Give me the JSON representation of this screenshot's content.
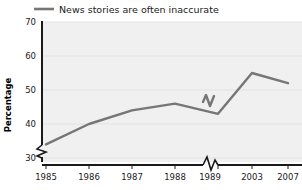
{
  "chart_data": {
    "type": "line",
    "title": "",
    "subtitle": "",
    "xlabel": "",
    "ylabel": "Percentage",
    "legend": [
      {
        "name": "News stories are often inaccurate",
        "color": "#767676",
        "marker": "line-swatch"
      }
    ],
    "legend_position": "top-left",
    "grid": true,
    "grid_axis": "y",
    "x": [
      "1985",
      "1986",
      "1987",
      "1988",
      "1989",
      "2003",
      "2007"
    ],
    "xtick_labels": [
      "1985",
      "1986",
      "1987",
      "1988",
      "1989",
      "2003",
      "2007"
    ],
    "ytick_labels": [
      "30",
      "40",
      "50",
      "60",
      "70"
    ],
    "ytick_values": [
      30,
      40,
      50,
      60,
      70
    ],
    "ylim": [
      30,
      70
    ],
    "axis_break_x": true,
    "axis_break_y": true,
    "series": [
      {
        "name": "News stories are often inaccurate",
        "color": "#767676",
        "values": [
          34,
          40,
          44,
          46,
          43,
          55,
          52
        ]
      }
    ]
  },
  "legend": {
    "entry_label": "News stories are often inaccurate"
  },
  "axes": {
    "y_title": "Percentage",
    "y_ticks": [
      "70",
      "60",
      "50",
      "40",
      "30"
    ],
    "x_ticks": [
      "1985",
      "1986",
      "1987",
      "1988",
      "1989",
      "2003",
      "2007"
    ]
  },
  "colors": {
    "line": "#767676",
    "plot_background": "#f0f0f0",
    "gridline": "#e2e2e2",
    "axis": "#1a1a1a",
    "text": "#1a1a1a"
  }
}
